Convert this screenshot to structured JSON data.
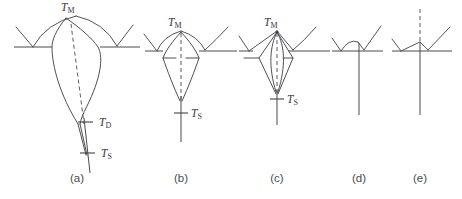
{
  "figure": {
    "background_color": "#ffffff",
    "line_color": "#4a4a4f",
    "label_color": "#38383d",
    "width": 462,
    "height": 199
  },
  "temperature_labels": {
    "melting": {
      "symbol": "T",
      "subscript": "M",
      "full": "TM"
    },
    "detachment": {
      "symbol": "T",
      "subscript": "D",
      "full": "TD"
    },
    "solidus": {
      "symbol": "T",
      "subscript": "S",
      "full": "TS"
    }
  },
  "panels": [
    {
      "id": "a",
      "caption": "(a)",
      "caption_x": 135,
      "has_body": true,
      "labels": [
        {
          "name": "tm",
          "symbol": "T",
          "subscript": "M",
          "x": 122,
          "y": 22
        },
        {
          "name": "td",
          "symbol": "T",
          "subscript": "D",
          "x": 172,
          "y": 127
        },
        {
          "name": "ts",
          "symbol": "T",
          "subscript": "S",
          "x": 172,
          "y": 158
        }
      ]
    },
    {
      "id": "b",
      "caption": "(b)",
      "caption_x": 310,
      "has_body": true,
      "labels": [
        {
          "name": "tm",
          "symbol": "T",
          "subscript": "M",
          "x": 314,
          "y": 32
        },
        {
          "name": "ts",
          "symbol": "T",
          "subscript": "S",
          "x": 330,
          "y": 118
        }
      ]
    },
    {
      "id": "c",
      "caption": "(c)",
      "caption_x": 470,
      "has_body": true,
      "labels": [
        {
          "name": "tm",
          "symbol": "T",
          "subscript": "M",
          "x": 474,
          "y": 32
        },
        {
          "name": "ts",
          "symbol": "T",
          "subscript": "S",
          "x": 490,
          "y": 104
        }
      ]
    },
    {
      "id": "d",
      "caption": "(d)",
      "caption_x": 600,
      "has_body": false,
      "labels": []
    },
    {
      "id": "e",
      "caption": "(e)",
      "caption_x": 722,
      "has_body": false,
      "labels": []
    }
  ],
  "captions": {
    "a": "(a)",
    "b": "(b)",
    "c": "(c)",
    "d": "(d)",
    "e": "(e)"
  },
  "caption_y": 182
}
